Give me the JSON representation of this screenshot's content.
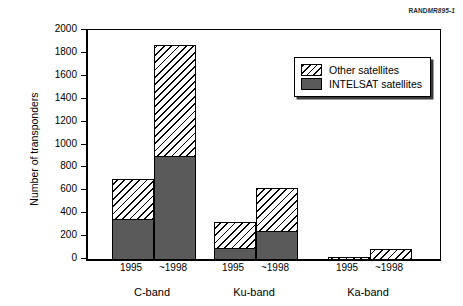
{
  "source_id": {
    "prefix": "RAND",
    "code": "MR895-1"
  },
  "chart_data": {
    "type": "bar",
    "subtype": "stacked-grouped",
    "title": "",
    "xlabel": "",
    "ylabel": "Number of transponders",
    "ylim": [
      0,
      2000
    ],
    "ytick_step": 200,
    "yticks": [
      0,
      200,
      400,
      600,
      800,
      1000,
      1200,
      1400,
      1600,
      1800,
      2000
    ],
    "grid": false,
    "legend_position": "upper-right-inside",
    "groups": [
      "C-band",
      "Ku-band",
      "Ka-band"
    ],
    "categories": [
      "1995",
      "~1998",
      "1995",
      "~1998",
      "1995",
      "~1998"
    ],
    "series": [
      {
        "name": "INTELSAT satellites",
        "style": "solid",
        "color": "#5a5a5a",
        "values": [
          350,
          900,
          100,
          245,
          0,
          0
        ]
      },
      {
        "name": "Other satellites",
        "style": "hatch",
        "color": "#ffffff",
        "values": [
          350,
          970,
          220,
          375,
          20,
          90
        ]
      }
    ],
    "totals": [
      700,
      1870,
      320,
      620,
      20,
      90
    ]
  },
  "legend": {
    "items": [
      {
        "label": "Other satellites",
        "style": "hatch"
      },
      {
        "label": "INTELSAT satellites",
        "style": "solid"
      }
    ]
  },
  "axis": {
    "y_labels": [
      "2000",
      "1800",
      "1600",
      "1400",
      "1200",
      "1000",
      "800",
      "600",
      "400",
      "200",
      "0"
    ],
    "y_title": "Number of transponders",
    "x_tick_labels": [
      "1995",
      "~1998",
      "1995",
      "~1998",
      "1995",
      "~1998"
    ],
    "x_group_labels": [
      "C-band",
      "Ku-band",
      "Ka-band"
    ]
  }
}
